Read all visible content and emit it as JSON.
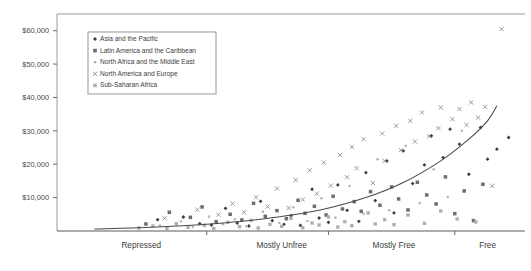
{
  "chart_data": {
    "type": "scatter",
    "title": "",
    "subtitle": "",
    "xlabel": "",
    "ylabel": "",
    "grid": false,
    "legend_position": "top-left-inside",
    "yticks": [
      "$10,000",
      "$20,000",
      "$30,000",
      "$40,000",
      "$50,000",
      "$60,000"
    ],
    "ytick_values": [
      10000,
      20000,
      30000,
      40000,
      50000,
      60000
    ],
    "ylim": [
      0,
      65000
    ],
    "xlim": [
      0,
      100
    ],
    "x_categories": [
      "Repressed",
      "Mostly Unfree",
      "Mostly Free",
      "Free"
    ],
    "x_category_positions": [
      18,
      48,
      72,
      92
    ],
    "x_tick_positions": [
      32,
      58,
      85
    ],
    "legend": [
      {
        "label": "Asia and the Pacific",
        "marker": "diamond",
        "color": "#3c3c5a"
      },
      {
        "label": "Latin America and the Caribbean",
        "marker": "square",
        "color": "#6d6d6d"
      },
      {
        "label": "North Africa and the Middle East",
        "marker": "dot-light",
        "color": "#b6b6b6"
      },
      {
        "label": "North America and Europe",
        "marker": "cross",
        "color": "#888888"
      },
      {
        "label": "Sub-Saharan Africa",
        "marker": "square-light",
        "color": "#b0b0b0"
      }
    ],
    "series": [
      {
        "name": "Asia and the Pacific",
        "marker": "diamond",
        "color": "#3c3c5a",
        "points": [
          [
            21.5,
            3400
          ],
          [
            27.0,
            4200
          ],
          [
            30.5,
            2200
          ],
          [
            33.0,
            1800
          ],
          [
            36.0,
            6800
          ],
          [
            38.5,
            2400
          ],
          [
            41.0,
            1500
          ],
          [
            43.5,
            8900
          ],
          [
            46.0,
            3100
          ],
          [
            48.5,
            2000
          ],
          [
            50.0,
            4600
          ],
          [
            52.0,
            1700
          ],
          [
            54.5,
            12500
          ],
          [
            56.0,
            3900
          ],
          [
            58.0,
            2600
          ],
          [
            60.0,
            13800
          ],
          [
            62.0,
            6200
          ],
          [
            64.5,
            2900
          ],
          [
            66.0,
            17500
          ],
          [
            68.0,
            9100
          ],
          [
            70.5,
            21000
          ],
          [
            72.0,
            5400
          ],
          [
            74.0,
            24000
          ],
          [
            76.0,
            14200
          ],
          [
            78.5,
            19800
          ],
          [
            80.0,
            28500
          ],
          [
            82.5,
            22000
          ],
          [
            84.0,
            30500
          ],
          [
            86.0,
            26000
          ],
          [
            88.0,
            17000
          ],
          [
            90.5,
            31000
          ],
          [
            92.0,
            21500
          ],
          [
            94.0,
            24500
          ],
          [
            96.5,
            28000
          ]
        ]
      },
      {
        "name": "Latin America and the Caribbean",
        "marker": "square",
        "color": "#6d6d6d",
        "points": [
          [
            19.0,
            2100
          ],
          [
            24.0,
            5600
          ],
          [
            28.5,
            4100
          ],
          [
            31.0,
            7200
          ],
          [
            34.0,
            2800
          ],
          [
            37.0,
            5000
          ],
          [
            39.5,
            3300
          ],
          [
            42.0,
            8300
          ],
          [
            44.5,
            4400
          ],
          [
            47.0,
            6100
          ],
          [
            49.0,
            3700
          ],
          [
            51.5,
            9200
          ],
          [
            53.0,
            5300
          ],
          [
            55.0,
            7400
          ],
          [
            57.5,
            4800
          ],
          [
            59.0,
            10400
          ],
          [
            61.0,
            6600
          ],
          [
            63.5,
            8800
          ],
          [
            65.0,
            5900
          ],
          [
            67.0,
            11800
          ],
          [
            69.0,
            7700
          ],
          [
            71.5,
            13200
          ],
          [
            73.0,
            9600
          ],
          [
            75.0,
            6300
          ],
          [
            77.0,
            14600
          ],
          [
            79.0,
            10800
          ],
          [
            81.0,
            8100
          ],
          [
            83.0,
            16200
          ],
          [
            85.0,
            5200
          ],
          [
            87.0,
            12000
          ],
          [
            89.0,
            3100
          ],
          [
            91.0,
            14000
          ]
        ]
      },
      {
        "name": "North Africa and the Middle East",
        "marker": "dot-light",
        "color": "#b6b6b6",
        "points": [
          [
            22.0,
            1600
          ],
          [
            26.5,
            2900
          ],
          [
            29.0,
            1200
          ],
          [
            32.5,
            4300
          ],
          [
            35.5,
            2000
          ],
          [
            38.0,
            3500
          ],
          [
            40.5,
            1400
          ],
          [
            44.0,
            5800
          ],
          [
            47.5,
            2400
          ],
          [
            50.5,
            7100
          ],
          [
            53.5,
            3000
          ],
          [
            56.5,
            9800
          ],
          [
            59.5,
            4000
          ],
          [
            62.5,
            13500
          ],
          [
            65.5,
            5100
          ],
          [
            68.5,
            21500
          ],
          [
            71.0,
            6200
          ],
          [
            74.5,
            25500
          ],
          [
            77.5,
            8400
          ],
          [
            80.5,
            18500
          ],
          [
            83.5,
            10200
          ],
          [
            86.5,
            30000
          ]
        ]
      },
      {
        "name": "North America and Europe",
        "marker": "cross",
        "color": "#888888",
        "points": [
          [
            23.0,
            3800
          ],
          [
            30.0,
            6400
          ],
          [
            34.5,
            4900
          ],
          [
            37.5,
            8200
          ],
          [
            40.0,
            5600
          ],
          [
            42.5,
            10100
          ],
          [
            45.0,
            7300
          ],
          [
            47.0,
            12700
          ],
          [
            49.5,
            6900
          ],
          [
            51.0,
            15300
          ],
          [
            52.5,
            9400
          ],
          [
            54.0,
            18200
          ],
          [
            55.5,
            11200
          ],
          [
            57.0,
            20500
          ],
          [
            58.5,
            13600
          ],
          [
            60.5,
            22800
          ],
          [
            62.0,
            16100
          ],
          [
            63.0,
            25200
          ],
          [
            64.0,
            18800
          ],
          [
            65.5,
            27500
          ],
          [
            67.5,
            14400
          ],
          [
            69.5,
            29200
          ],
          [
            70.0,
            21000
          ],
          [
            72.5,
            31500
          ],
          [
            73.5,
            24200
          ],
          [
            75.5,
            33000
          ],
          [
            76.5,
            26800
          ],
          [
            78.0,
            35500
          ],
          [
            79.5,
            28400
          ],
          [
            81.5,
            30800
          ],
          [
            82.0,
            37000
          ],
          [
            84.5,
            33500
          ],
          [
            86.0,
            36500
          ],
          [
            87.5,
            31800
          ],
          [
            88.5,
            38500
          ],
          [
            90.0,
            34000
          ],
          [
            91.5,
            37200
          ],
          [
            93.0,
            13500
          ],
          [
            95.0,
            60500
          ]
        ]
      },
      {
        "name": "Sub-Saharan Africa",
        "marker": "square-light",
        "color": "#b0b0b0",
        "points": [
          [
            17.5,
            900
          ],
          [
            20.5,
            1500
          ],
          [
            23.5,
            800
          ],
          [
            25.5,
            2200
          ],
          [
            28.0,
            1100
          ],
          [
            31.5,
            1700
          ],
          [
            33.5,
            700
          ],
          [
            36.5,
            2600
          ],
          [
            39.0,
            1300
          ],
          [
            41.5,
            3200
          ],
          [
            43.0,
            900
          ],
          [
            45.5,
            2000
          ],
          [
            48.0,
            1400
          ],
          [
            50.0,
            3800
          ],
          [
            52.5,
            1000
          ],
          [
            54.5,
            2400
          ],
          [
            56.0,
            1800
          ],
          [
            58.0,
            4200
          ],
          [
            60.0,
            1200
          ],
          [
            61.5,
            2800
          ],
          [
            63.0,
            1600
          ],
          [
            66.5,
            5400
          ],
          [
            68.0,
            2100
          ],
          [
            70.0,
            3400
          ],
          [
            72.0,
            1900
          ],
          [
            75.0,
            4800
          ],
          [
            78.5,
            2300
          ],
          [
            82.0,
            6000
          ],
          [
            85.5,
            3600
          ],
          [
            89.5,
            2700
          ]
        ]
      }
    ],
    "trendline": {
      "name": "fitted-trend",
      "type": "exponential",
      "color": "#4a4a4a",
      "points": [
        [
          8,
          600
        ],
        [
          20,
          1100
        ],
        [
          32,
          2000
        ],
        [
          44,
          3600
        ],
        [
          56,
          6200
        ],
        [
          66,
          10000
        ],
        [
          74,
          14500
        ],
        [
          82,
          21000
        ],
        [
          88,
          27500
        ],
        [
          92,
          33000
        ],
        [
          94,
          37500
        ]
      ]
    }
  }
}
